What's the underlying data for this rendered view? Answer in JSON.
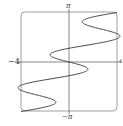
{
  "chart_data": {
    "type": "line",
    "title": "",
    "xlabel": "",
    "ylabel": "",
    "xlim": [
      -4,
      4
    ],
    "ylim": [
      -3.14159,
      3.14159
    ],
    "grid": false,
    "legend": null,
    "tick_labels": {
      "x_min": "−4",
      "x_max": "4",
      "y_max": "π",
      "y_min": "−π"
    },
    "series": [
      {
        "name": "parametric curve",
        "description": "x as oscillating function of y, passing from (−4,−π) through origin to (4,π)",
        "formula_estimate": "x = (4/π)·y − 2.2·sin(3y)",
        "color": "#333333"
      }
    ]
  },
  "labels": {
    "top": "π",
    "bottom": "−π",
    "left": "−4",
    "right": "4"
  },
  "colors": {
    "axis": "#555555",
    "frame": "#777777",
    "curve": "#333333"
  }
}
